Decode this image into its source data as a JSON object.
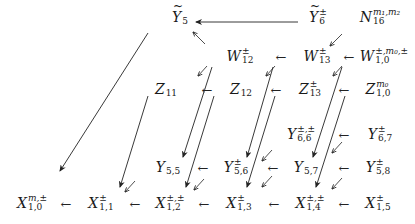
{
  "diagram": {
    "type": "commutative-diagram",
    "left_arrow_glyph": "←",
    "nodes": [
      {
        "id": "Y5t",
        "base": "Y",
        "tilde": true,
        "sup": "",
        "sub": "5",
        "x": 180,
        "y": 18
      },
      {
        "id": "Y6t",
        "base": "Y",
        "tilde": true,
        "sup": "±",
        "sub": "6",
        "x": 318,
        "y": 18
      },
      {
        "id": "N16",
        "base": "N",
        "tilde": false,
        "sup": "m₁,m₂",
        "sub": "16",
        "x": 380,
        "y": 18
      },
      {
        "id": "W12",
        "base": "W",
        "tilde": false,
        "sup": "±",
        "sub": "12",
        "x": 240,
        "y": 57
      },
      {
        "id": "W13",
        "base": "W",
        "tilde": false,
        "sup": "±",
        "sub": "13",
        "x": 317,
        "y": 57
      },
      {
        "id": "W10",
        "base": "W",
        "tilde": false,
        "sup": "±,m₀,±",
        "sub": "1,0",
        "x": 384,
        "y": 57
      },
      {
        "id": "Z11",
        "base": "Z",
        "tilde": false,
        "sup": "",
        "sub": "11",
        "x": 166,
        "y": 90
      },
      {
        "id": "Z12",
        "base": "Z",
        "tilde": false,
        "sup": "",
        "sub": "12",
        "x": 241,
        "y": 90
      },
      {
        "id": "Z13",
        "base": "Z",
        "tilde": false,
        "sup": "±",
        "sub": "13",
        "x": 310,
        "y": 90
      },
      {
        "id": "Z10",
        "base": "Z",
        "tilde": false,
        "sup": "m₀",
        "sub": "1,0",
        "x": 378,
        "y": 90
      },
      {
        "id": "Y66",
        "base": "Y",
        "tilde": false,
        "sup": "±,±",
        "sub": "6,6",
        "x": 301,
        "y": 135
      },
      {
        "id": "Y67",
        "base": "Y",
        "tilde": false,
        "sup": "±",
        "sub": "6,7",
        "x": 380,
        "y": 135
      },
      {
        "id": "Y55",
        "base": "Y",
        "tilde": false,
        "sup": "",
        "sub": "5,5",
        "x": 168,
        "y": 168
      },
      {
        "id": "Y56",
        "base": "Y",
        "tilde": false,
        "sup": "±",
        "sub": "5,6",
        "x": 236,
        "y": 168
      },
      {
        "id": "Y57",
        "base": "Y",
        "tilde": false,
        "sup": "",
        "sub": "5,7",
        "x": 306,
        "y": 168
      },
      {
        "id": "Y58",
        "base": "Y",
        "tilde": false,
        "sup": "±",
        "sub": "5,8",
        "x": 378,
        "y": 168
      },
      {
        "id": "X10",
        "base": "X",
        "tilde": false,
        "sup": "m,±",
        "sub": "1,0",
        "x": 32,
        "y": 204
      },
      {
        "id": "X11",
        "base": "X",
        "tilde": false,
        "sup": "±",
        "sub": "1,1",
        "x": 101,
        "y": 204
      },
      {
        "id": "X12",
        "base": "X",
        "tilde": false,
        "sup": "±,±",
        "sub": "1,2",
        "x": 170,
        "y": 204
      },
      {
        "id": "X13",
        "base": "X",
        "tilde": false,
        "sup": "±",
        "sub": "1,3",
        "x": 239,
        "y": 204
      },
      {
        "id": "X14",
        "base": "X",
        "tilde": false,
        "sup": "±,±",
        "sub": "1,4",
        "x": 310,
        "y": 204
      },
      {
        "id": "X15",
        "base": "X",
        "tilde": false,
        "sup": "±",
        "sub": "1,5",
        "x": 378,
        "y": 204
      }
    ],
    "left_arrows": [
      {
        "from": "W13",
        "to": "W12",
        "x": 281,
        "y": 57
      },
      {
        "from": "W10",
        "to": "W13",
        "x": 349,
        "y": 57
      },
      {
        "from": "Z12",
        "to": "Z11",
        "x": 207,
        "y": 90
      },
      {
        "from": "Z13",
        "to": "Z12",
        "x": 276,
        "y": 90
      },
      {
        "from": "Z10",
        "to": "Z13",
        "x": 344,
        "y": 90
      },
      {
        "from": "Y67",
        "to": "Y66",
        "x": 344,
        "y": 135
      },
      {
        "from": "Y56",
        "to": "Y55",
        "x": 203,
        "y": 168
      },
      {
        "from": "Y57",
        "to": "Y56",
        "x": 273,
        "y": 168
      },
      {
        "from": "Y58",
        "to": "Y57",
        "x": 344,
        "y": 168
      },
      {
        "from": "X11",
        "to": "X10",
        "x": 66,
        "y": 204
      },
      {
        "from": "X12",
        "to": "X11",
        "x": 135,
        "y": 204
      },
      {
        "from": "X13",
        "to": "X12",
        "x": 204,
        "y": 204
      },
      {
        "from": "X14",
        "to": "X13",
        "x": 274,
        "y": 204
      },
      {
        "from": "X15",
        "to": "X14",
        "x": 344,
        "y": 204
      }
    ],
    "long_arrows": [
      {
        "from": "Y6t",
        "to": "Y5t",
        "x1": 298,
        "y1": 22,
        "x2": 196,
        "y2": 22
      },
      {
        "from": "Y5t",
        "to": "X10",
        "x1": 148,
        "y1": 33,
        "x2": 60,
        "y2": 171
      },
      {
        "from": "Z11",
        "to": "X11",
        "x1": 148,
        "y1": 96,
        "x2": 120,
        "y2": 187
      },
      {
        "from": "W12",
        "to": "Y55",
        "x1": 212,
        "y1": 67,
        "x2": 183,
        "y2": 157
      },
      {
        "from": "Z12",
        "to": "X12",
        "x1": 214,
        "y1": 96,
        "x2": 186,
        "y2": 187
      },
      {
        "from": "W13",
        "to": "Y56",
        "x1": 273,
        "y1": 67,
        "x2": 247,
        "y2": 157
      },
      {
        "from": "Z13",
        "to": "X13",
        "x1": 275,
        "y1": 96,
        "x2": 247,
        "y2": 187
      },
      {
        "from": "W10",
        "to": "Y57",
        "x1": 342,
        "y1": 67,
        "x2": 313,
        "y2": 157
      },
      {
        "from": "Z10",
        "to": "X14",
        "x1": 345,
        "y1": 96,
        "x2": 316,
        "y2": 187
      }
    ],
    "short_diag_arrows": [
      {
        "x1": 205,
        "y1": 44,
        "x2": 193,
        "y2": 32
      },
      {
        "x1": 342,
        "y1": 34,
        "x2": 330,
        "y2": 46
      },
      {
        "x1": 207,
        "y1": 66,
        "x2": 198,
        "y2": 76
      },
      {
        "x1": 275,
        "y1": 66,
        "x2": 266,
        "y2": 76
      },
      {
        "x1": 342,
        "y1": 66,
        "x2": 333,
        "y2": 76
      },
      {
        "x1": 342,
        "y1": 142,
        "x2": 332,
        "y2": 153
      },
      {
        "x1": 342,
        "y1": 178,
        "x2": 332,
        "y2": 189
      },
      {
        "x1": 272,
        "y1": 176,
        "x2": 262,
        "y2": 187
      },
      {
        "x1": 272,
        "y1": 150,
        "x2": 262,
        "y2": 161
      },
      {
        "x1": 204,
        "y1": 179,
        "x2": 194,
        "y2": 190
      },
      {
        "x1": 135,
        "y1": 181,
        "x2": 125,
        "y2": 192
      }
    ]
  }
}
